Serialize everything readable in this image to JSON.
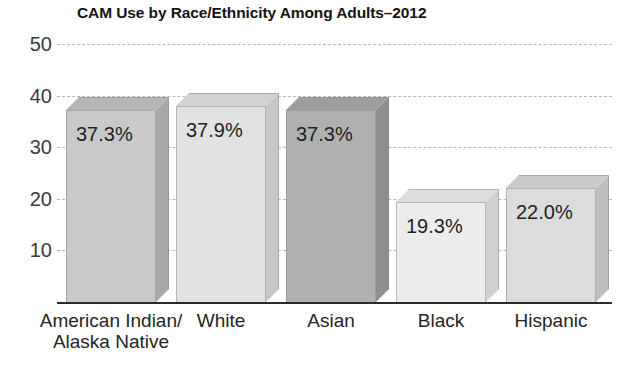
{
  "chart_data": {
    "type": "bar",
    "title": "CAM Use by Race/Ethnicity Among Adults–2012",
    "xlabel": "",
    "ylabel": "",
    "ylim": [
      0,
      50
    ],
    "yticks": [
      "10",
      "20",
      "30",
      "40",
      "50"
    ],
    "grid": true,
    "legend": "none",
    "categories": [
      "American Indian/\nAlaska Native",
      "White",
      "Asian",
      "Black",
      "Hispanic"
    ],
    "values": [
      37.3,
      37.9,
      37.3,
      19.3,
      22.0
    ],
    "value_labels": [
      "37.3%",
      "37.9%",
      "37.3%",
      "19.3%",
      "22.0%"
    ],
    "bar_colors": [
      "#c9c9c9",
      "#e2e2e2",
      "#b0b0b0",
      "#ececec",
      "#dcdcdc"
    ],
    "bar_top_colors": [
      "#b5b5b5",
      "#d2d2d2",
      "#9d9d9d",
      "#dcdcdc",
      "#cacaca"
    ],
    "bar_side_colors": [
      "#a8a8a8",
      "#c6c6c6",
      "#8e8e8e",
      "#d0d0d0",
      "#bebebe"
    ]
  },
  "axis": {
    "grid_color": "#b6b6b6",
    "baseline_color": "#2b2b2b",
    "tick_text_color": "#3b3b3b"
  }
}
